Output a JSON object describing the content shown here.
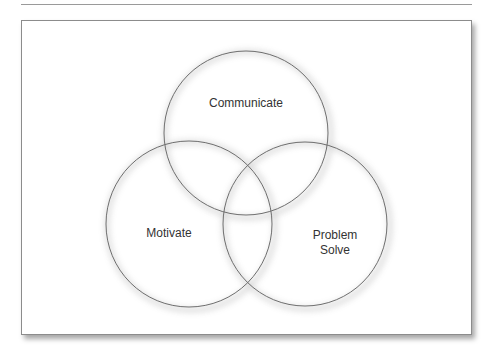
{
  "diagram": {
    "type": "venn",
    "circles": [
      {
        "id": "top",
        "label": "Communicate",
        "cx": 246,
        "cy": 133,
        "r": 82
      },
      {
        "id": "left",
        "label": "Motivate",
        "cx": 189,
        "cy": 224,
        "r": 83
      },
      {
        "id": "right",
        "label": "Problem Solve",
        "cx": 305,
        "cy": 224,
        "r": 82
      }
    ],
    "labels": {
      "communicate": "Communicate",
      "motivate": "Motivate",
      "problem_line1": "Problem",
      "problem_line2": "Solve"
    },
    "colors": {
      "stroke": "#6e6e6e",
      "text": "#333333",
      "background": "#ffffff"
    }
  }
}
